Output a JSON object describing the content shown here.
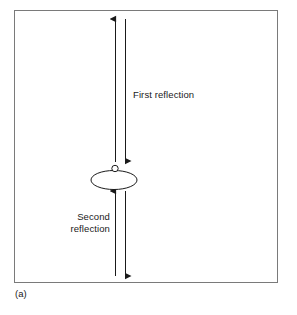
{
  "figure": {
    "caption": "(a)",
    "border_color": "#7a7a7a",
    "stroke_color": "#1a1a1a",
    "background": "#ffffff",
    "labels": {
      "first_reflection": "First reflection",
      "second_reflection": "Second\nreflection"
    },
    "elements": {
      "transducer_name": "transducer-ellipse",
      "up_arrow_upper_name": "first-reflection-up-arrow",
      "down_arrow_upper_name": "first-reflection-down-arrow",
      "up_arrow_lower_name": "second-reflection-up-arrow",
      "down_arrow_lower_name": "second-reflection-down-arrow"
    }
  }
}
